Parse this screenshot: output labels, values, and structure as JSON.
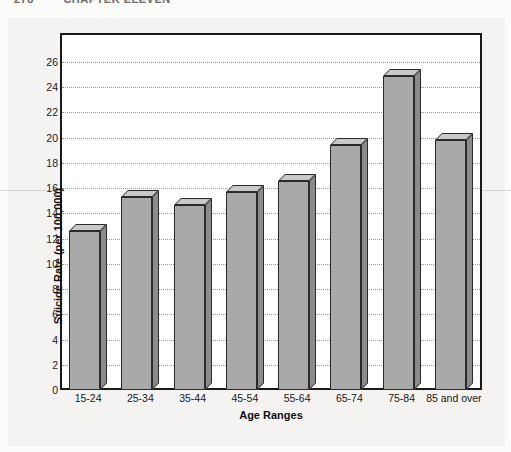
{
  "page_header": {
    "page_number": "278",
    "running_head": "CHAPTER ELEVEN"
  },
  "chart_data": {
    "type": "bar",
    "title": "",
    "xlabel": "Age Ranges",
    "ylabel": "Suicide Rate (per 100,000)",
    "categories": [
      "15-24",
      "25-34",
      "35-44",
      "45-54",
      "55-64",
      "65-74",
      "75-84",
      "85 and over"
    ],
    "values": [
      12.6,
      15.3,
      14.7,
      15.7,
      16.6,
      19.4,
      24.9,
      19.8
    ],
    "ylim": [
      0,
      26
    ],
    "ytick_labels": [
      "0",
      "2",
      "4",
      "6",
      "8",
      "10",
      "12",
      "14",
      "16",
      "18",
      "20",
      "22",
      "24",
      "26"
    ],
    "ytick_values": [
      0,
      2,
      4,
      6,
      8,
      10,
      12,
      14,
      16,
      18,
      20,
      22,
      24,
      26
    ],
    "grid": true,
    "legend": "none",
    "series": [
      {
        "name": "Suicide Rate",
        "values": [
          12.6,
          15.3,
          14.7,
          15.7,
          16.6,
          19.4,
          24.9,
          19.8
        ]
      }
    ],
    "colors": {
      "bar_front": "#a9a9a9",
      "bar_top": "#c9c9c9",
      "bar_side": "#8b8b8b",
      "bar_outline": "#2b2b2b",
      "gridline": "#9a9a9a",
      "frame": "#1a1a1a",
      "plot_background": "#ffffff",
      "page_background": "#f4f3f1"
    }
  }
}
